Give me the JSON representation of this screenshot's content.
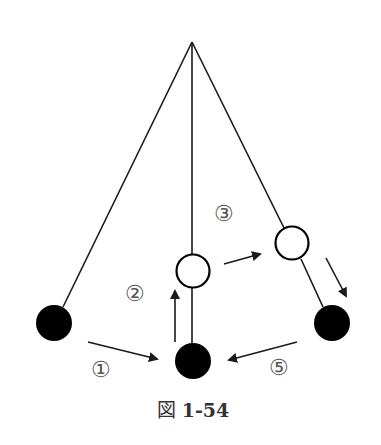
{
  "figure": {
    "caption_prefix": "図",
    "caption_number": "1-54",
    "colors": {
      "line": "#1a1a1a",
      "ball_filled": "#000000",
      "ball_open_fill": "#ffffff",
      "label": "#555555"
    },
    "pivot": {
      "x": 192,
      "y": 42
    },
    "balls": [
      {
        "id": "left-black",
        "type": "filled",
        "cx": 54,
        "cy": 323,
        "r": 18
      },
      {
        "id": "bottom-black",
        "type": "filled",
        "cx": 193,
        "cy": 361,
        "r": 18
      },
      {
        "id": "center-open",
        "type": "open",
        "cx": 193,
        "cy": 271,
        "r": 17
      },
      {
        "id": "right-open",
        "type": "open",
        "cx": 292,
        "cy": 243,
        "r": 17
      },
      {
        "id": "right-black",
        "type": "filled",
        "cx": 332,
        "cy": 323,
        "r": 18
      }
    ],
    "labels": [
      {
        "id": "step-1",
        "text": "①",
        "x": 101,
        "y": 370
      },
      {
        "id": "step-2",
        "text": "②",
        "x": 135,
        "y": 294
      },
      {
        "id": "step-3",
        "text": "③",
        "x": 224,
        "y": 214
      },
      {
        "id": "step-5",
        "text": "⑤",
        "x": 279,
        "y": 368
      }
    ]
  }
}
